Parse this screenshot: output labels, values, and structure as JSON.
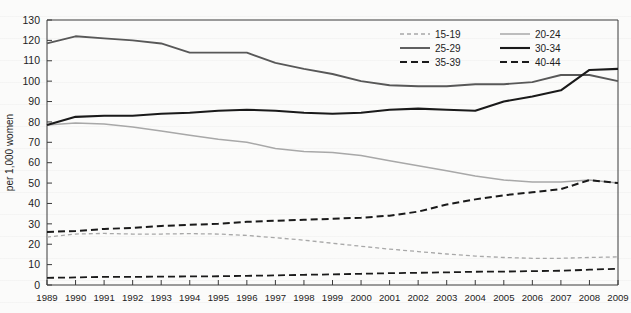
{
  "chart_data": {
    "type": "line",
    "title": "",
    "xlabel": "",
    "ylabel": "per 1,000 women",
    "ylim": [
      0,
      130
    ],
    "ytick_step": 10,
    "yticks": [
      0,
      10,
      20,
      30,
      40,
      50,
      60,
      70,
      80,
      90,
      100,
      110,
      120,
      130
    ],
    "grid": false,
    "legend_position": "top-right-inside",
    "x": [
      1989,
      1990,
      1991,
      1992,
      1993,
      1994,
      1995,
      1996,
      1997,
      1998,
      1999,
      2000,
      2001,
      2002,
      2003,
      2004,
      2005,
      2006,
      2007,
      2008,
      2009
    ],
    "categories": [
      "1989",
      "1990",
      "1991",
      "1992",
      "1993",
      "1994",
      "1995",
      "1996",
      "1997",
      "1998",
      "1999",
      "2000",
      "2001",
      "2002",
      "2003",
      "2004",
      "2005",
      "2006",
      "2007",
      "2008",
      "2009"
    ],
    "series": [
      {
        "name": "15-19",
        "style": "dashed",
        "color": "#a8a8a8",
        "width": 1.3,
        "dash": "4,3",
        "values": [
          23.5,
          25.0,
          25.3,
          25.0,
          25.0,
          25.2,
          25.0,
          24.3,
          23.2,
          22.0,
          20.5,
          19.0,
          17.6,
          16.4,
          15.2,
          14.2,
          13.5,
          13.1,
          13.1,
          13.5,
          13.8
        ]
      },
      {
        "name": "20-24",
        "style": "solid",
        "color": "#a8a8a8",
        "width": 1.5,
        "dash": "",
        "values": [
          78.5,
          79.5,
          79.0,
          77.5,
          75.5,
          73.5,
          71.5,
          70.0,
          67.0,
          65.5,
          65.0,
          63.5,
          61.0,
          58.5,
          56.0,
          53.5,
          51.5,
          50.5,
          50.5,
          51.5,
          50.0
        ]
      },
      {
        "name": "25-29",
        "style": "solid",
        "color": "#585858",
        "width": 1.9,
        "dash": "",
        "values": [
          118.5,
          122.0,
          121.0,
          120.0,
          118.5,
          114.0,
          114.0,
          114.0,
          109.0,
          106.0,
          103.5,
          100.0,
          98.0,
          97.5,
          97.5,
          98.5,
          98.5,
          99.5,
          103.0,
          103.0,
          100.0
        ]
      },
      {
        "name": "30-34",
        "style": "solid",
        "color": "#1a1a1a",
        "width": 2.1,
        "dash": "",
        "values": [
          78.5,
          82.5,
          83.0,
          83.0,
          84.0,
          84.5,
          85.5,
          86.0,
          85.5,
          84.5,
          84.0,
          84.5,
          86.0,
          86.5,
          86.0,
          85.5,
          90.0,
          92.5,
          95.5,
          105.5,
          106.0
        ]
      },
      {
        "name": "35-39",
        "style": "dashed",
        "color": "#1a1a1a",
        "width": 2.0,
        "dash": "7,4",
        "values": [
          26.0,
          26.5,
          27.5,
          28.0,
          29.0,
          29.5,
          30.0,
          31.0,
          31.5,
          32.0,
          32.5,
          33.0,
          34.0,
          36.0,
          39.5,
          42.0,
          44.0,
          45.5,
          47.0,
          51.5,
          50.0
        ]
      },
      {
        "name": "40-44",
        "style": "dashed",
        "color": "#1a1a1a",
        "width": 1.8,
        "dash": "7,4",
        "values": [
          3.5,
          3.7,
          4.0,
          4.0,
          4.1,
          4.2,
          4.3,
          4.5,
          4.7,
          5.0,
          5.2,
          5.5,
          5.8,
          6.0,
          6.2,
          6.5,
          6.6,
          6.8,
          7.0,
          7.5,
          8.0
        ]
      }
    ],
    "legend": [
      {
        "label": "15-19",
        "color": "#a8a8a8",
        "dash": "4,3",
        "width": 1.3
      },
      {
        "label": "20-24",
        "color": "#a8a8a8",
        "dash": "",
        "width": 1.5
      },
      {
        "label": "25-29",
        "color": "#585858",
        "dash": "",
        "width": 1.9
      },
      {
        "label": "30-34",
        "color": "#1a1a1a",
        "dash": "",
        "width": 2.1
      },
      {
        "label": "35-39",
        "color": "#1a1a1a",
        "dash": "7,4",
        "width": 2.0
      },
      {
        "label": "40-44",
        "color": "#1a1a1a",
        "dash": "7,4",
        "width": 1.8
      }
    ]
  }
}
